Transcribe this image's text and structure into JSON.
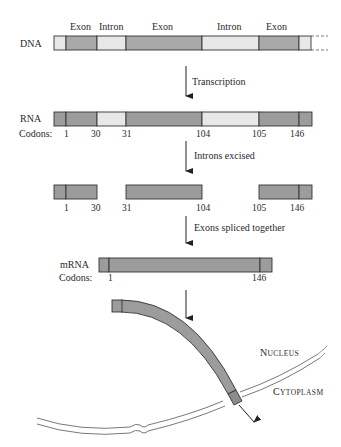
{
  "colors": {
    "exon_dna": "#a9a9a9",
    "intron": "#e8e8e8",
    "exon_rna": "#9c9c9c",
    "outline": "#333333",
    "membrane": "#555555"
  },
  "dna": {
    "label": "DNA",
    "segment_labels": [
      "Exon",
      "Intron",
      "Exon",
      "Intron",
      "Exon"
    ]
  },
  "steps": {
    "transcription": "Transcription",
    "introns_excised": "Introns excised",
    "exons_spliced": "Exons spliced together"
  },
  "rna": {
    "label": "RNA",
    "codons_label": "Codons:",
    "codons": [
      "1",
      "30",
      "31",
      "104",
      "105",
      "146"
    ]
  },
  "excised": {
    "codons": [
      "1",
      "30",
      "31",
      "104",
      "105",
      "146"
    ]
  },
  "mrna": {
    "label": "mRNA",
    "codons_label": "Codons:",
    "codons": [
      "1",
      "146"
    ]
  },
  "export": {
    "nucleus_first": "N",
    "nucleus_rest": "UCLEUS",
    "cytoplasm_first": "C",
    "cytoplasm_rest": "YTOPLASM"
  }
}
